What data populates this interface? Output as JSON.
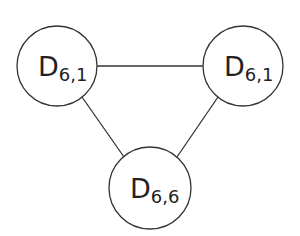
{
  "diagram": {
    "type": "graph",
    "colors": {
      "stroke": "#333333",
      "background": "#ffffff",
      "text": "#222222"
    },
    "nodes": [
      {
        "id": "n1",
        "label": "D",
        "sub": "6,1",
        "cx": 57,
        "cy": 66,
        "r": 40
      },
      {
        "id": "n2",
        "label": "D",
        "sub": "6,1",
        "cx": 243,
        "cy": 66,
        "r": 40
      },
      {
        "id": "n3",
        "label": "D",
        "sub": "6,6",
        "cx": 150,
        "cy": 188,
        "r": 41
      }
    ],
    "edges": [
      {
        "from": "n1",
        "to": "n2"
      },
      {
        "from": "n1",
        "to": "n3"
      },
      {
        "from": "n2",
        "to": "n3"
      }
    ]
  }
}
